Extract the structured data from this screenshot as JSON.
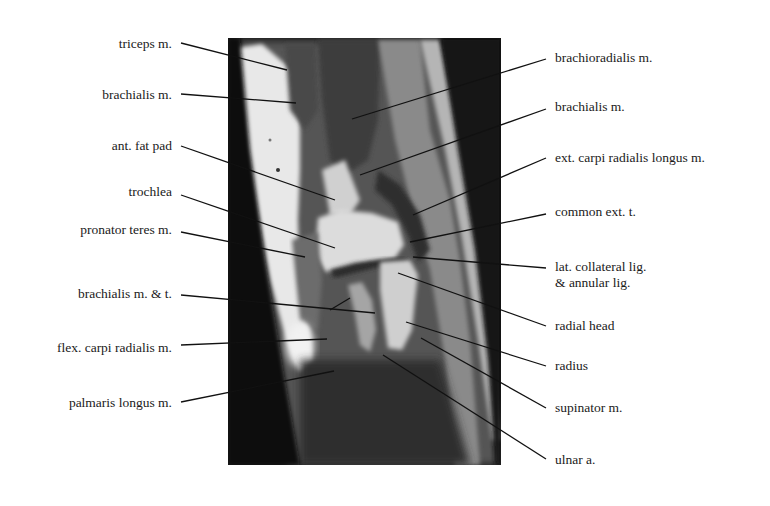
{
  "figure": {
    "image_frame": {
      "x": 228,
      "y": 38,
      "width": 273,
      "height": 427
    },
    "line_color": "#111111",
    "text_color": "#1a1a1a",
    "background": "#ffffff"
  },
  "labels_left": [
    {
      "id": "triceps",
      "text": "triceps m.",
      "text_right": 172,
      "text_y": 36,
      "line": [
        181,
        43,
        287,
        70
      ]
    },
    {
      "id": "brachialis-left",
      "text": "brachialis m.",
      "text_right": 172,
      "text_y": 87,
      "line": [
        181,
        94,
        296,
        103
      ]
    },
    {
      "id": "ant-fat-pad",
      "text": "ant. fat pad",
      "text_right": 172,
      "text_y": 138,
      "line": [
        181,
        146,
        335,
        200
      ]
    },
    {
      "id": "trochlea",
      "text": "trochlea",
      "text_right": 172,
      "text_y": 184,
      "line": [
        181,
        195,
        335,
        248
      ]
    },
    {
      "id": "pronator-teres",
      "text": "pronator teres m.",
      "text_right": 172,
      "text_y": 222,
      "line": [
        181,
        232,
        305,
        257
      ]
    },
    {
      "id": "brachialis-tendon",
      "text": "brachialis m. & t.",
      "text_right": 172,
      "text_y": 286,
      "line": [
        181,
        295,
        375,
        313
      ],
      "branch": [
        330,
        310,
        350,
        298
      ]
    },
    {
      "id": "flex-carpi-radialis",
      "text": "flex. carpi radialis m.",
      "text_right": 172,
      "text_y": 340,
      "line": [
        181,
        345,
        327,
        339
      ]
    },
    {
      "id": "palmaris-longus",
      "text": "palmaris longus  m.",
      "text_right": 172,
      "text_y": 395,
      "line": [
        181,
        402,
        334,
        371
      ]
    }
  ],
  "labels_right": [
    {
      "id": "brachioradialis",
      "text": "brachioradialis m.",
      "text_left": 555,
      "text_y": 50,
      "line": [
        546,
        59,
        352,
        119
      ]
    },
    {
      "id": "brachialis-right",
      "text": "brachialis m.",
      "text_left": 555,
      "text_y": 99,
      "line": [
        546,
        109,
        360,
        175
      ]
    },
    {
      "id": "ext-carpi-radialis-longus",
      "text": "ext. carpi radialis longus  m.",
      "text_left": 555,
      "text_y": 150,
      "line": [
        546,
        158,
        413,
        215
      ]
    },
    {
      "id": "common-ext-tendon",
      "text": "common ext. t.",
      "text_left": 555,
      "text_y": 204,
      "line": [
        546,
        214,
        410,
        242
      ]
    },
    {
      "id": "lat-collateral-lig",
      "text": "lat. collateral lig.",
      "text2": "& annular lig.",
      "text_left": 555,
      "text_y": 259,
      "line": [
        546,
        268,
        413,
        257
      ]
    },
    {
      "id": "radial-head",
      "text": "radial head",
      "text_left": 555,
      "text_y": 318,
      "line": [
        546,
        326,
        398,
        273
      ]
    },
    {
      "id": "radius",
      "text": "radius",
      "text_left": 555,
      "text_y": 358,
      "line": [
        546,
        366,
        406,
        322
      ]
    },
    {
      "id": "supinator",
      "text": "supinator  m.",
      "text_left": 555,
      "text_y": 403,
      "line": [
        546,
        408,
        421,
        338
      ]
    },
    {
      "id": "ulnar-artery",
      "text": "ulnar a.",
      "text_left": 555,
      "text_y": 455,
      "line": [
        546,
        459,
        383,
        355
      ]
    }
  ]
}
